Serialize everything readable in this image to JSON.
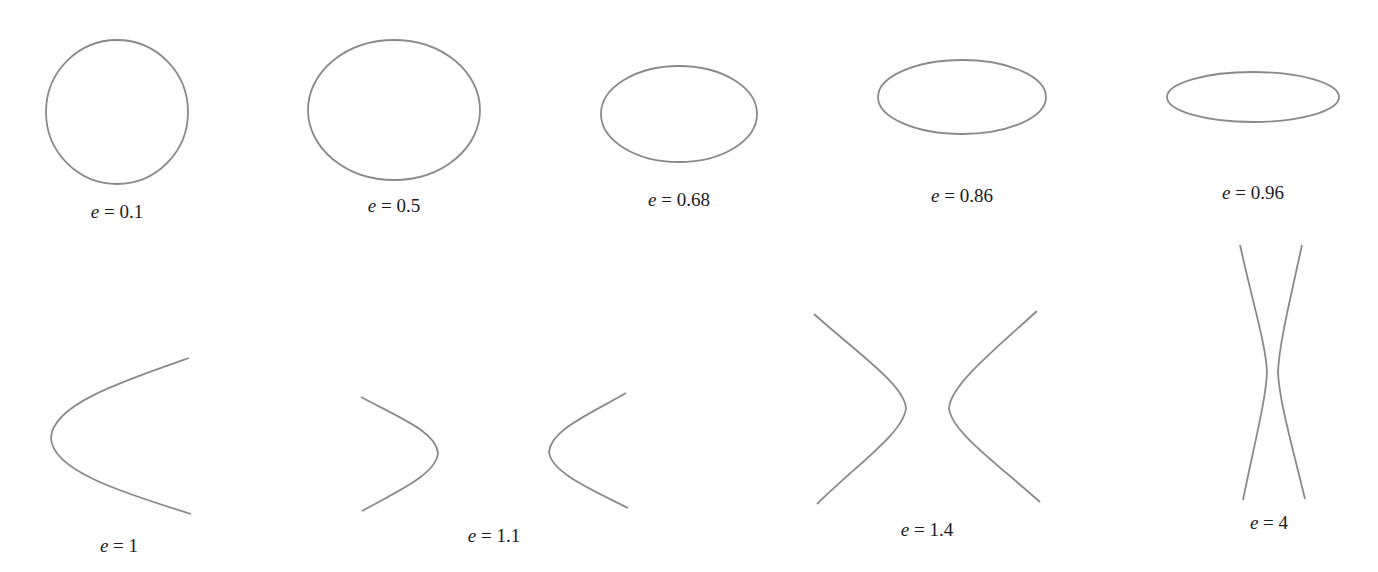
{
  "figure": {
    "stroke_color": "#8a8a8a",
    "text_color": "#1a1a1a",
    "background": "#ffffff"
  },
  "variable": "e",
  "equals": " = ",
  "conics": [
    {
      "id": "e01",
      "e_label": "0.1",
      "type": "ellipse",
      "cx": 117,
      "cy": 112,
      "rx": 71,
      "ry": 72,
      "label_x": 117,
      "label_y": 212
    },
    {
      "id": "e05",
      "e_label": "0.5",
      "type": "ellipse",
      "cx": 394,
      "cy": 110,
      "rx": 86,
      "ry": 70,
      "label_x": 394,
      "label_y": 206
    },
    {
      "id": "e068",
      "e_label": "0.68",
      "type": "ellipse",
      "cx": 679,
      "cy": 114,
      "rx": 78,
      "ry": 48,
      "label_x": 679,
      "label_y": 200
    },
    {
      "id": "e086",
      "e_label": "0.86",
      "type": "ellipse",
      "cx": 962,
      "cy": 97,
      "rx": 84,
      "ry": 37,
      "label_x": 962,
      "label_y": 196
    },
    {
      "id": "e096",
      "e_label": "0.96",
      "type": "ellipse",
      "cx": 1253,
      "cy": 97,
      "rx": 86,
      "ry": 25,
      "label_x": 1253,
      "label_y": 193
    },
    {
      "id": "e1",
      "e_label": "1",
      "type": "parabola",
      "label_x": 119,
      "label_y": 546
    },
    {
      "id": "e11",
      "e_label": "1.1",
      "type": "hyperbola",
      "label_x": 494,
      "label_y": 536
    },
    {
      "id": "e14",
      "e_label": "1.4",
      "type": "hyperbola",
      "label_x": 927,
      "label_y": 530
    },
    {
      "id": "e4",
      "e_label": "4",
      "type": "hyperbola",
      "label_x": 1269,
      "label_y": 523
    }
  ],
  "labels": {
    "e01": "0.1",
    "e05": "0.5",
    "e068": "0.68",
    "e086": "0.86",
    "e096": "0.96",
    "e1": "1",
    "e11": "1.1",
    "e14": "1.4",
    "e4": "4"
  }
}
